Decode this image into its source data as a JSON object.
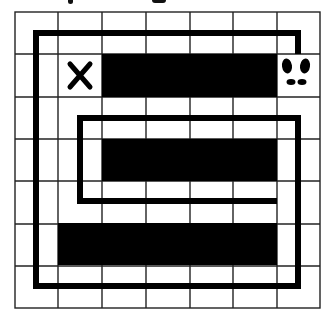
{
  "puzzle": {
    "type": "path-maze-grid",
    "grid": {
      "rows": 7,
      "cols": 7,
      "origin_x": 15,
      "origin_y": 12,
      "cell_w": 43.6,
      "cell_h": 42.3,
      "line_color": "#222222"
    },
    "blocked_cells": [
      {
        "row": 1,
        "col_start": 2,
        "col_end": 5
      },
      {
        "row": 3,
        "col_start": 2,
        "col_end": 5
      },
      {
        "row": 5,
        "col_start": 1,
        "col_end": 5
      }
    ],
    "start_marker": {
      "icon": "x-mark-icon",
      "row": 1,
      "col": 1,
      "glyph": "✕"
    },
    "end_marker": {
      "icon": "footprints-icon",
      "row": 1,
      "col": 6
    },
    "path_color": "#000000",
    "block_color": "#000000"
  }
}
